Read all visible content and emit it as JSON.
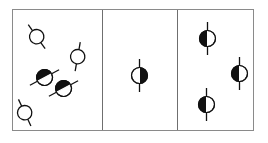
{
  "figure": {
    "type": "diagram",
    "title": "",
    "background_color": "#ffffff",
    "width": 268,
    "height": 143
  },
  "frame": {
    "x": 12,
    "y": 9,
    "width": 242,
    "height": 122,
    "border_color": "#8a8a8a",
    "border_width": 1.5,
    "fill": "#ffffff"
  },
  "dividers": [
    {
      "name": "divider-1",
      "x": 102,
      "color": "#6f6f6f",
      "width": 1.3
    },
    {
      "name": "divider-2",
      "x": 177,
      "color": "#6f6f6f",
      "width": 1.3
    }
  ],
  "ink_color": "#111111",
  "panels": [
    {
      "name": "panel-left",
      "index": 0,
      "x": 12,
      "width": 90,
      "label": "",
      "particles": [
        {
          "name": "particle-open-1",
          "style": "open",
          "cx": 37,
          "cy": 37,
          "r": 7.2,
          "rotation": -35,
          "tail_length": 7.5,
          "stroke": 1.3
        },
        {
          "name": "particle-open-2",
          "style": "open",
          "cx": 78,
          "cy": 57,
          "r": 7.2,
          "rotation": 190,
          "tail_length": 7.5,
          "stroke": 1.3
        },
        {
          "name": "particle-filled-1",
          "style": "half-filled",
          "cx": 44,
          "cy": 77,
          "r": 8.0,
          "rotation": -118,
          "tail_length": 8.5,
          "stroke": 1.3
        },
        {
          "name": "particle-filled-2",
          "style": "half-filled",
          "cx": 63,
          "cy": 88,
          "r": 8.0,
          "rotation": -118,
          "tail_length": 8.5,
          "stroke": 1.3
        },
        {
          "name": "particle-open-3",
          "style": "open",
          "cx": 25,
          "cy": 113,
          "r": 7.2,
          "rotation": -25,
          "tail_length": 7.5,
          "stroke": 1.3
        }
      ]
    },
    {
      "name": "panel-middle",
      "index": 1,
      "x": 102,
      "width": 75,
      "label": "",
      "particles": [
        {
          "name": "particle-filled-3",
          "style": "half-filled",
          "cx": 139,
          "cy": 75,
          "r": 8.0,
          "rotation": 0,
          "tail_length": 8.5,
          "stroke": 1.3
        }
      ]
    },
    {
      "name": "panel-right",
      "index": 2,
      "x": 177,
      "width": 77,
      "label": "",
      "particles": [
        {
          "name": "particle-filled-4",
          "style": "half-filled",
          "cx": 207,
          "cy": 38,
          "r": 8.0,
          "rotation": 180,
          "tail_length": 8.5,
          "stroke": 1.3
        },
        {
          "name": "particle-filled-5",
          "style": "half-filled",
          "cx": 239,
          "cy": 73,
          "r": 8.0,
          "rotation": 180,
          "tail_length": 8.5,
          "stroke": 1.3
        },
        {
          "name": "particle-filled-6",
          "style": "half-filled",
          "cx": 206,
          "cy": 104,
          "r": 8.0,
          "rotation": 180,
          "tail_length": 8.5,
          "stroke": 1.3
        }
      ]
    }
  ]
}
